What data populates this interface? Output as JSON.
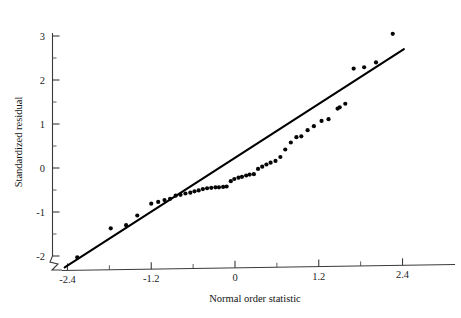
{
  "chart_data": {
    "type": "scatter",
    "title": "",
    "subtitle": "",
    "xlabel": "Normal order statistic",
    "ylabel": "Standardized residual",
    "xlim": [
      -2.6,
      2.55
    ],
    "ylim": [
      -2.35,
      3.25
    ],
    "xticks": [
      -2.4,
      -1.2,
      0,
      1.2,
      2.4
    ],
    "xticklabels": [
      "-2.4",
      "-1.2",
      "0",
      "1.2",
      "2.4"
    ],
    "xminorticks": [
      -1.8,
      -0.6,
      0.6,
      1.8
    ],
    "yticks": [
      -2,
      -1,
      0,
      1,
      2,
      3
    ],
    "yticklabels": [
      "-2",
      "-1",
      "0",
      "1",
      "2",
      "3"
    ],
    "yminorticks": [
      -1.5,
      -0.5,
      0.5,
      1.5,
      2.5
    ],
    "grid": false,
    "legend": null,
    "axis_break": "y-axis broken below -2 at origin",
    "annotations": [],
    "series": [
      {
        "name": "standardized residuals vs normal order statistic",
        "marker": "filled-circle",
        "marker_size_px": 3.0,
        "color": "#060606",
        "points": [
          [
            -2.26,
            -2.03
          ],
          [
            -1.78,
            -1.37
          ],
          [
            -1.56,
            -1.3
          ],
          [
            -1.4,
            -1.08
          ],
          [
            -1.2,
            -0.81
          ],
          [
            -1.1,
            -0.77
          ],
          [
            -1.01,
            -0.73
          ],
          [
            -0.93,
            -0.7
          ],
          [
            -0.85,
            -0.63
          ],
          [
            -0.78,
            -0.61
          ],
          [
            -0.71,
            -0.58
          ],
          [
            -0.64,
            -0.56
          ],
          [
            -0.58,
            -0.53
          ],
          [
            -0.52,
            -0.51
          ],
          [
            -0.46,
            -0.48
          ],
          [
            -0.4,
            -0.46
          ],
          [
            -0.34,
            -0.45
          ],
          [
            -0.28,
            -0.44
          ],
          [
            -0.23,
            -0.44
          ],
          [
            -0.17,
            -0.43
          ],
          [
            -0.12,
            -0.42
          ],
          [
            -0.06,
            -0.3
          ],
          [
            -0.01,
            -0.25
          ],
          [
            0.05,
            -0.22
          ],
          [
            0.1,
            -0.2
          ],
          [
            0.16,
            -0.17
          ],
          [
            0.21,
            -0.15
          ],
          [
            0.27,
            -0.14
          ],
          [
            0.33,
            -0.02
          ],
          [
            0.39,
            0.03
          ],
          [
            0.45,
            0.08
          ],
          [
            0.51,
            0.12
          ],
          [
            0.58,
            0.16
          ],
          [
            0.65,
            0.25
          ],
          [
            0.72,
            0.42
          ],
          [
            0.8,
            0.58
          ],
          [
            0.88,
            0.7
          ],
          [
            0.95,
            0.72
          ],
          [
            1.04,
            0.86
          ],
          [
            1.13,
            0.95
          ],
          [
            1.24,
            1.07
          ],
          [
            1.34,
            1.11
          ],
          [
            1.47,
            1.35
          ],
          [
            1.5,
            1.38
          ],
          [
            1.58,
            1.46
          ],
          [
            1.7,
            2.26
          ],
          [
            1.85,
            2.29
          ],
          [
            2.02,
            2.4
          ],
          [
            2.26,
            3.05
          ]
        ]
      }
    ],
    "reference_line": {
      "name": "reference line",
      "type": "straight",
      "color": "#000000",
      "x_start": -2.44,
      "y_start": -2.26,
      "x_end": 2.42,
      "y_end": 2.7,
      "slope": 1.02,
      "intercept": 0.22
    }
  },
  "axes": {
    "x_title": "Normal order statistic",
    "y_title": "Standardized residual"
  }
}
